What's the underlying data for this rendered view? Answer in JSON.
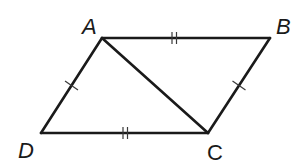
{
  "diagram": {
    "type": "geometry",
    "shape": "parallelogram",
    "name": "ABCD",
    "stroke_color": "#1a1a1a",
    "vertices": {
      "A": {
        "label": "A",
        "x": 102,
        "y": 38
      },
      "B": {
        "label": "B",
        "x": 270,
        "y": 38
      },
      "C": {
        "label": "C",
        "x": 208,
        "y": 133
      },
      "D": {
        "label": "D",
        "x": 41,
        "y": 133
      }
    },
    "segments": [
      {
        "from": "A",
        "to": "B",
        "tick_marks": 2
      },
      {
        "from": "B",
        "to": "C",
        "tick_marks": 1
      },
      {
        "from": "C",
        "to": "D",
        "tick_marks": 2
      },
      {
        "from": "D",
        "to": "A",
        "tick_marks": 1
      },
      {
        "from": "A",
        "to": "C",
        "tick_marks": 0,
        "role": "diagonal"
      }
    ],
    "congruences": [
      {
        "segments": [
          "AB",
          "DC"
        ],
        "marks": "double"
      },
      {
        "segments": [
          "AD",
          "BC"
        ],
        "marks": "single"
      }
    ]
  }
}
